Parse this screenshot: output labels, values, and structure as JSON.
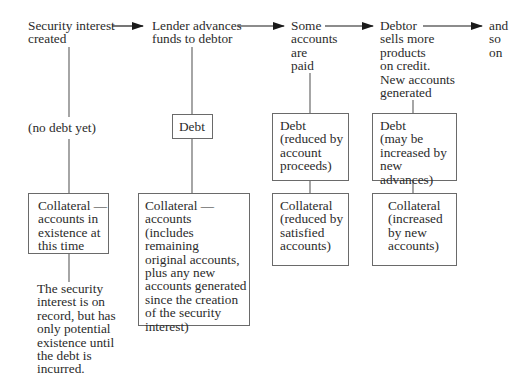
{
  "diagram": {
    "type": "flow",
    "stages": [
      {
        "id": "stage-1",
        "title": "Security interest\ncreated",
        "debt": "(no debt yet)",
        "collateral": "Collateral —\naccounts in\nexistence at\nthis time",
        "note": "The security\ninterest is on\nrecord, but has\nonly potential\nexistence until\nthe debt is\nincurred."
      },
      {
        "id": "stage-2",
        "title": "Lender advances\nfunds to debtor",
        "debt": "Debt",
        "collateral": "Collateral —\naccounts\n(includes remaining\noriginal accounts,\nplus any new\naccounts generated\nsince the creation\nof the security\ninterest)"
      },
      {
        "id": "stage-3",
        "title": "Some\naccounts\nare\npaid",
        "debt": "Debt\n(reduced by\naccount\nproceeds)",
        "collateral": "Collateral\n(reduced by\nsatisfied\naccounts)"
      },
      {
        "id": "stage-4",
        "title": "Debtor\nsells more\nproducts\non credit.\nNew accounts\ngenerated",
        "debt": "Debt\n(may be\nincreased by\nnew advances)",
        "collateral": "Collateral\n(increased\nby new\naccounts)"
      },
      {
        "id": "stage-5",
        "title": "and\nso\non"
      }
    ],
    "colors": {
      "text": "#2b2b2b",
      "lines": "#6a6a6a",
      "arrow": "#1a1a1a",
      "background": "#ffffff"
    }
  }
}
